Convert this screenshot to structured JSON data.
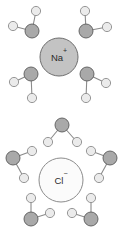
{
  "figure": {
    "background_color": "#ffffff",
    "width": 122,
    "height": 246
  },
  "palette": {
    "oxygen_fill": "#a9a9a9",
    "oxygen_stroke": "#5b5b5b",
    "hydrogen_fill": "#ebebeb",
    "hydrogen_stroke": "#8c8c8c",
    "bond_stroke": "#8a8a8a",
    "cation_fill": "#c3c3c3",
    "cation_stroke": "#6e6e6e",
    "anion_fill": "#fbfbfb",
    "anion_stroke": "#8c8c8c",
    "label_color": "#2b2b2b"
  },
  "ions": [
    {
      "id": "sodium-ion",
      "symbol": "Na",
      "charge": "+",
      "label": "Na+",
      "cx": 59,
      "cy": 57,
      "r": 19,
      "style": "cation"
    },
    {
      "id": "chloride-ion",
      "symbol": "Cl",
      "charge": "−",
      "label": "Cl−",
      "cx": 61,
      "cy": 180,
      "r": 22,
      "style": "anion"
    }
  ],
  "atom_radii": {
    "oxygen": 7,
    "hydrogen": 4.6
  },
  "water_molecules": [
    {
      "id": "water-na-top-left",
      "shell": "sodium-ion",
      "oxygen": {
        "cx": 32,
        "cy": 31
      },
      "hydrogens": [
        {
          "cx": 36,
          "cy": 11
        },
        {
          "cx": 13,
          "cy": 26
        }
      ]
    },
    {
      "id": "water-na-top-right",
      "shell": "sodium-ion",
      "oxygen": {
        "cx": 86,
        "cy": 31
      },
      "hydrogens": [
        {
          "cx": 85,
          "cy": 11
        },
        {
          "cx": 107,
          "cy": 27
        }
      ]
    },
    {
      "id": "water-na-mid-left",
      "shell": "sodium-ion",
      "oxygen": {
        "cx": 31,
        "cy": 74
      },
      "hydrogens": [
        {
          "cx": 14,
          "cy": 82
        },
        {
          "cx": 32,
          "cy": 98
        }
      ]
    },
    {
      "id": "water-na-mid-right",
      "shell": "sodium-ion",
      "oxygen": {
        "cx": 87,
        "cy": 74
      },
      "hydrogens": [
        {
          "cx": 106,
          "cy": 83
        },
        {
          "cx": 86,
          "cy": 98
        }
      ]
    },
    {
      "id": "water-cl-top",
      "shell": "chloride-ion",
      "oxygen": {
        "cx": 62,
        "cy": 125
      },
      "hydrogens": [
        {
          "cx": 48,
          "cy": 142
        },
        {
          "cx": 77,
          "cy": 142
        }
      ]
    },
    {
      "id": "water-cl-upper-left",
      "shell": "chloride-ion",
      "oxygen": {
        "cx": 13,
        "cy": 158
      },
      "hydrogens": [
        {
          "cx": 32,
          "cy": 151
        },
        {
          "cx": 24,
          "cy": 178
        }
      ]
    },
    {
      "id": "water-cl-upper-right",
      "shell": "chloride-ion",
      "oxygen": {
        "cx": 110,
        "cy": 158
      },
      "hydrogens": [
        {
          "cx": 91,
          "cy": 151
        },
        {
          "cx": 99,
          "cy": 178
        }
      ]
    },
    {
      "id": "water-cl-lower-left",
      "shell": "chloride-ion",
      "oxygen": {
        "cx": 31,
        "cy": 219
      },
      "hydrogens": [
        {
          "cx": 31,
          "cy": 198
        },
        {
          "cx": 50,
          "cy": 213
        }
      ]
    },
    {
      "id": "water-cl-lower-right",
      "shell": "chloride-ion",
      "oxygen": {
        "cx": 91,
        "cy": 219
      },
      "hydrogens": [
        {
          "cx": 91,
          "cy": 198
        },
        {
          "cx": 72,
          "cy": 213
        }
      ]
    }
  ]
}
